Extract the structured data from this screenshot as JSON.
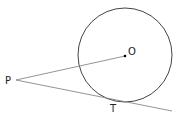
{
  "diagram": {
    "labels": {
      "center": "O",
      "external_point": "P",
      "tangent_point": "T"
    },
    "colors": {
      "circle": "#444444",
      "lines": "#888888",
      "text": "#222222"
    }
  }
}
